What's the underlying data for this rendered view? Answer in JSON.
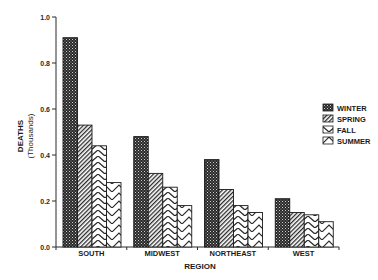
{
  "chart_data": {
    "type": "bar",
    "title": "",
    "xlabel": "REGION",
    "ylabel": "DEATHS",
    "ylabel_sub": "(Thousands)",
    "ylim": [
      0,
      1.0
    ],
    "yticks": [
      0.0,
      0.2,
      0.4,
      0.6,
      0.8,
      1.0
    ],
    "ytick_labels": [
      "0.0",
      "0.2",
      "0.4",
      "0.6",
      "0.8",
      "1.0"
    ],
    "grid": false,
    "legend_position": "right",
    "categories": [
      "SOUTH",
      "MIDWEST",
      "NORTHEAST",
      "WEST"
    ],
    "series": [
      {
        "name": "WINTER",
        "pattern": "dots",
        "values": [
          0.91,
          0.48,
          0.38,
          0.21
        ]
      },
      {
        "name": "SPRING",
        "pattern": "fine-diagonal",
        "values": [
          0.53,
          0.32,
          0.25,
          0.15
        ]
      },
      {
        "name": "FALL",
        "pattern": "chevron",
        "values": [
          0.44,
          0.26,
          0.18,
          0.14
        ]
      },
      {
        "name": "SUMMER",
        "pattern": "coarse-chevron",
        "values": [
          0.28,
          0.18,
          0.15,
          0.11
        ]
      }
    ]
  },
  "colors": {
    "ink": "#1a1a1a",
    "background": "#ffffff"
  }
}
